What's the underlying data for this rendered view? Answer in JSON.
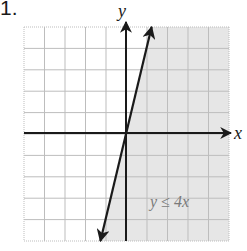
{
  "problem": {
    "number": "1."
  },
  "chart_data": {
    "type": "line",
    "title": "",
    "xlabel": "x",
    "ylabel": "y",
    "xlim": [
      -5,
      5
    ],
    "ylim": [
      -5,
      5
    ],
    "grid": true,
    "grid_step": 1,
    "tick_labels": [],
    "series": [
      {
        "name": "y = 4x",
        "equation": "y = 4x",
        "style": "solid",
        "x": [
          -1.25,
          0,
          1.25
        ],
        "values": [
          -5,
          0,
          5
        ]
      }
    ],
    "shaded_region": {
      "inequality": "y ≤ 4x",
      "side": "below/right of line",
      "color": "#e6e6e6"
    },
    "annotations": [
      {
        "text": "y ≤ 4x",
        "x": 3.6,
        "y": -4.2
      }
    ]
  },
  "labels": {
    "x_axis": "x",
    "y_axis": "y",
    "inequality": "y ≤ 4x"
  },
  "colors": {
    "grid": "#bdbdbd",
    "axis": "#1a1a1a",
    "shade": "#e6e6e6",
    "label": "#7a7a7a"
  }
}
